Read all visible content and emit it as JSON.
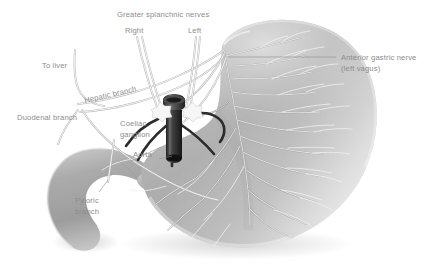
{
  "figure": {
    "background_color": "#ffffff",
    "label_color": "#8c8c8c",
    "organ_color": "#a8a8a8",
    "aorta_color": "#2f2f2f",
    "ganglion_color": "#f4f4f4"
  },
  "labels": {
    "greater_splanchnic": "Greater splanchnic nerves",
    "right": "Right",
    "left": "Left",
    "anterior_gastric_line1": "Anterior gastric nerve",
    "anterior_gastric_line2": "(left vagus)",
    "to_liver": "To liver",
    "hepatic_branch": "Hepatic branch",
    "duodenal_branch": "Duodenal branch",
    "coeliac_line1": "Coeliac",
    "coeliac_line2": "ganglion",
    "aorta": "Aorta",
    "pyloric_line1": "Pyloric",
    "pyloric_line2": "branch"
  },
  "structures": {
    "stomach": "stomach-body",
    "duodenum": "duodenum",
    "aorta": "aorta-vessel",
    "coeliac_ganglion_right": "coeliac-ganglion-right",
    "coeliac_ganglion_left": "coeliac-ganglion-left"
  }
}
